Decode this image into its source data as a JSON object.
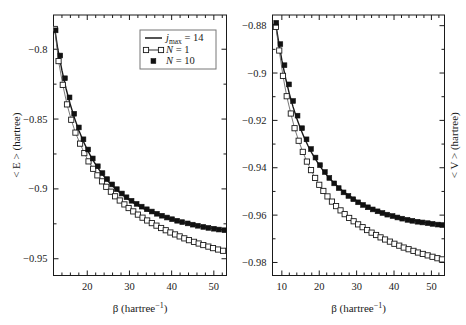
{
  "figure": {
    "panels": [
      "left",
      "right"
    ]
  },
  "chart_data": [
    {
      "type": "scatter",
      "panel": "left",
      "title": "",
      "xlabel": "β (hartree⁻¹)",
      "ylabel": "< E > (hartree)",
      "ylabel_side": "left",
      "xlim": [
        12,
        53
      ],
      "ylim": [
        -0.962,
        -0.7755
      ],
      "xticks": [
        20,
        30,
        40,
        50
      ],
      "xticklabels": [
        "20",
        "30",
        "40",
        "50"
      ],
      "yticks": [
        -0.8,
        -0.85,
        -0.9,
        -0.95
      ],
      "yticklabels": [
        "−0.8",
        "−0.85",
        "−0.9",
        "−0.95"
      ],
      "xminorticks": [
        14,
        16,
        18,
        22,
        24,
        26,
        28,
        32,
        34,
        36,
        38,
        42,
        44,
        46,
        48,
        52
      ],
      "yminorticks": [
        -0.825,
        -0.875,
        -0.925
      ],
      "grid": false,
      "legend_position": "upper right",
      "series": [
        {
          "name": "j_max = 14",
          "marker": "none",
          "linestyle": "solid",
          "color": "#1a1a1a",
          "x": [
            12.3,
            13,
            14,
            15,
            16,
            17,
            18,
            19,
            20,
            21,
            22,
            23,
            24,
            25,
            26,
            27,
            28,
            29,
            30,
            31,
            32,
            33,
            34,
            35,
            36,
            37,
            38,
            39,
            40,
            41,
            42,
            43,
            44,
            45,
            46,
            47,
            48,
            49,
            50,
            51,
            52,
            52.8
          ],
          "y": [
            -0.7855,
            -0.7995,
            -0.8152,
            -0.8285,
            -0.8398,
            -0.8495,
            -0.858,
            -0.8654,
            -0.8719,
            -0.8776,
            -0.8826,
            -0.8871,
            -0.8911,
            -0.8947,
            -0.8979,
            -0.9008,
            -0.9034,
            -0.9058,
            -0.908,
            -0.91,
            -0.9118,
            -0.9135,
            -0.915,
            -0.9164,
            -0.9177,
            -0.9189,
            -0.92,
            -0.921,
            -0.9219,
            -0.9228,
            -0.9236,
            -0.9243,
            -0.925,
            -0.9257,
            -0.9263,
            -0.9268,
            -0.9274,
            -0.9279,
            -0.9283,
            -0.9288,
            -0.9292,
            -0.9295
          ]
        },
        {
          "name": "N = 1",
          "marker": "open-square",
          "linestyle": "solid-thin",
          "color": "#1a1a1a",
          "x": [
            12.3,
            13.2,
            14.2,
            15.2,
            16.2,
            17.2,
            18.3,
            19.3,
            20.3,
            21.4,
            22.4,
            23.5,
            24.5,
            25.6,
            26.6,
            27.7,
            28.8,
            29.8,
            30.9,
            32.0,
            33.1,
            34.2,
            35.3,
            36.4,
            37.5,
            38.6,
            39.7,
            40.8,
            41.9,
            43.0,
            44.1,
            45.3,
            46.4,
            47.5,
            48.7,
            49.8,
            51.0,
            52.2
          ],
          "y": [
            -0.7855,
            -0.8085,
            -0.8255,
            -0.8395,
            -0.8505,
            -0.8597,
            -0.8676,
            -0.8744,
            -0.8803,
            -0.8856,
            -0.8903,
            -0.8946,
            -0.8985,
            -0.902,
            -0.9053,
            -0.9083,
            -0.9111,
            -0.9137,
            -0.9161,
            -0.9184,
            -0.9206,
            -0.9226,
            -0.9245,
            -0.9263,
            -0.928,
            -0.9296,
            -0.9312,
            -0.9326,
            -0.934,
            -0.9354,
            -0.9367,
            -0.9379,
            -0.9391,
            -0.9402,
            -0.9413,
            -0.9424,
            -0.9434,
            -0.9443
          ]
        },
        {
          "name": "N = 10",
          "marker": "filled-square",
          "linestyle": "none",
          "color": "#111111",
          "x": [
            12.5,
            13.6,
            14.7,
            15.8,
            16.9,
            18.0,
            19.1,
            20.2,
            21.3,
            22.5,
            23.6,
            24.7,
            25.9,
            27.0,
            28.2,
            29.3,
            30.5,
            31.7,
            32.9,
            34.1,
            35.3,
            36.5,
            37.7,
            38.9,
            40.1,
            41.3,
            42.5,
            43.8,
            45.0,
            46.2,
            47.5,
            48.7,
            50.0,
            51.2,
            52.5
          ],
          "y": [
            -0.7865,
            -0.8045,
            -0.8208,
            -0.8345,
            -0.8462,
            -0.856,
            -0.8645,
            -0.8718,
            -0.8782,
            -0.8838,
            -0.8887,
            -0.893,
            -0.8968,
            -0.9002,
            -0.9033,
            -0.906,
            -0.9085,
            -0.9107,
            -0.9127,
            -0.9146,
            -0.9162,
            -0.9178,
            -0.9192,
            -0.9205,
            -0.9217,
            -0.9228,
            -0.9238,
            -0.9247,
            -0.9256,
            -0.9264,
            -0.9272,
            -0.9279,
            -0.9285,
            -0.9291,
            -0.9296
          ]
        }
      ]
    },
    {
      "type": "scatter",
      "panel": "right",
      "title": "",
      "xlabel": "β (hartree⁻¹)",
      "ylabel": "< V > (hartree)",
      "ylabel_side": "right",
      "xlim": [
        7.5,
        53.5
      ],
      "ylim": [
        -0.9855,
        -0.8755
      ],
      "xticks": [
        10,
        20,
        30,
        40,
        50
      ],
      "xticklabels": [
        "10",
        "20",
        "30",
        "40",
        "50"
      ],
      "yticks": [
        -0.88,
        -0.9,
        -0.92,
        -0.94,
        -0.96,
        -0.98
      ],
      "yticklabels": [
        "−0.88",
        "−0.9",
        "−0.92",
        "−0.94",
        "−0.96",
        "−0.98"
      ],
      "xminorticks": [
        12,
        14,
        16,
        18,
        22,
        24,
        26,
        28,
        32,
        34,
        36,
        38,
        42,
        44,
        46,
        48,
        52
      ],
      "yminorticks": [
        -0.89,
        -0.91,
        -0.93,
        -0.95,
        -0.97
      ],
      "grid": false,
      "legend_position": "none",
      "series": [
        {
          "name": "j_max = 14",
          "marker": "none",
          "linestyle": "solid",
          "color": "#1a1a1a",
          "x": [
            8.3,
            9,
            10,
            11,
            12,
            13,
            14,
            15,
            16,
            17,
            18,
            19,
            20,
            21,
            22,
            23,
            24,
            25,
            26,
            27,
            28,
            29,
            30,
            31,
            32,
            33,
            34,
            35,
            36,
            37,
            38,
            39,
            40,
            41,
            42,
            43,
            44,
            45,
            46,
            47,
            48,
            49,
            50,
            51,
            52,
            53
          ],
          "y": [
            -0.8785,
            -0.8855,
            -0.8946,
            -0.9022,
            -0.9087,
            -0.9143,
            -0.9192,
            -0.9235,
            -0.9273,
            -0.9307,
            -0.9337,
            -0.9364,
            -0.9389,
            -0.9411,
            -0.9431,
            -0.9449,
            -0.9465,
            -0.948,
            -0.9494,
            -0.9507,
            -0.9518,
            -0.9529,
            -0.9539,
            -0.9548,
            -0.9556,
            -0.9564,
            -0.9571,
            -0.9578,
            -0.9584,
            -0.959,
            -0.9595,
            -0.96,
            -0.9604,
            -0.9608,
            -0.9612,
            -0.9616,
            -0.9619,
            -0.9622,
            -0.9625,
            -0.9628,
            -0.9631,
            -0.9633,
            -0.9635,
            -0.9637,
            -0.9639,
            -0.9641
          ]
        },
        {
          "name": "N = 1",
          "marker": "open-square",
          "linestyle": "solid-thin",
          "color": "#1a1a1a",
          "x": [
            8.4,
            9.3,
            10.3,
            11.3,
            12.4,
            13.4,
            14.5,
            15.6,
            16.7,
            17.8,
            18.9,
            20.0,
            21.1,
            22.2,
            23.4,
            24.5,
            25.7,
            26.8,
            28.0,
            29.2,
            30.4,
            31.6,
            32.8,
            34.0,
            35.2,
            36.4,
            37.6,
            38.9,
            40.1,
            41.4,
            42.6,
            43.9,
            45.2,
            46.4,
            47.7,
            49.0,
            50.3,
            51.6,
            52.8
          ],
          "y": [
            -0.8805,
            -0.8905,
            -0.9012,
            -0.9098,
            -0.9171,
            -0.9233,
            -0.9286,
            -0.9333,
            -0.9374,
            -0.941,
            -0.9443,
            -0.9472,
            -0.9498,
            -0.9521,
            -0.9543,
            -0.9562,
            -0.958,
            -0.9596,
            -0.9612,
            -0.9626,
            -0.9639,
            -0.9651,
            -0.9663,
            -0.9674,
            -0.9684,
            -0.9694,
            -0.9703,
            -0.9712,
            -0.9721,
            -0.9729,
            -0.9737,
            -0.9744,
            -0.9751,
            -0.9758,
            -0.9764,
            -0.977,
            -0.9776,
            -0.9782,
            -0.9787
          ]
        },
        {
          "name": "N = 10",
          "marker": "filled-square",
          "linestyle": "none",
          "color": "#111111",
          "x": [
            8.5,
            9.6,
            10.7,
            11.9,
            13.0,
            14.2,
            15.4,
            16.6,
            17.8,
            19.0,
            20.2,
            21.5,
            22.7,
            24.0,
            25.2,
            26.5,
            27.8,
            29.1,
            30.4,
            31.7,
            33.0,
            34.3,
            35.6,
            36.9,
            38.2,
            39.6,
            40.9,
            42.2,
            43.6,
            44.9,
            46.3,
            47.6,
            49.0,
            50.3,
            51.7,
            52.9
          ],
          "y": [
            -0.8788,
            -0.8878,
            -0.8967,
            -0.9048,
            -0.9118,
            -0.918,
            -0.9233,
            -0.928,
            -0.9321,
            -0.9357,
            -0.9389,
            -0.9418,
            -0.9443,
            -0.9466,
            -0.9486,
            -0.9504,
            -0.9519,
            -0.9533,
            -0.9546,
            -0.9557,
            -0.9567,
            -0.9576,
            -0.9584,
            -0.9591,
            -0.9598,
            -0.9604,
            -0.961,
            -0.9615,
            -0.962,
            -0.9624,
            -0.9628,
            -0.9631,
            -0.9634,
            -0.9637,
            -0.964,
            -0.9642
          ]
        }
      ]
    }
  ],
  "legend": {
    "entries": [
      {
        "label": "j",
        "sub": "max",
        "suffix": "= 14",
        "style": "line"
      },
      {
        "label": "N",
        "sub": "",
        "suffix": "= 1",
        "style": "open-square-line"
      },
      {
        "label": "N",
        "sub": "",
        "suffix": "= 10",
        "style": "filled-square"
      }
    ],
    "entry0_full": "jₘₐₓ = 14",
    "entry1_full": "N = 1",
    "entry2_full": "N = 10"
  },
  "colors": {
    "axis": "#1a1a1a",
    "curve_thick": "#1a1a1a",
    "curve_thin": "#555555",
    "marker_open_fill": "#ffffff",
    "marker_fill": "#111111",
    "background": "#ffffff"
  }
}
